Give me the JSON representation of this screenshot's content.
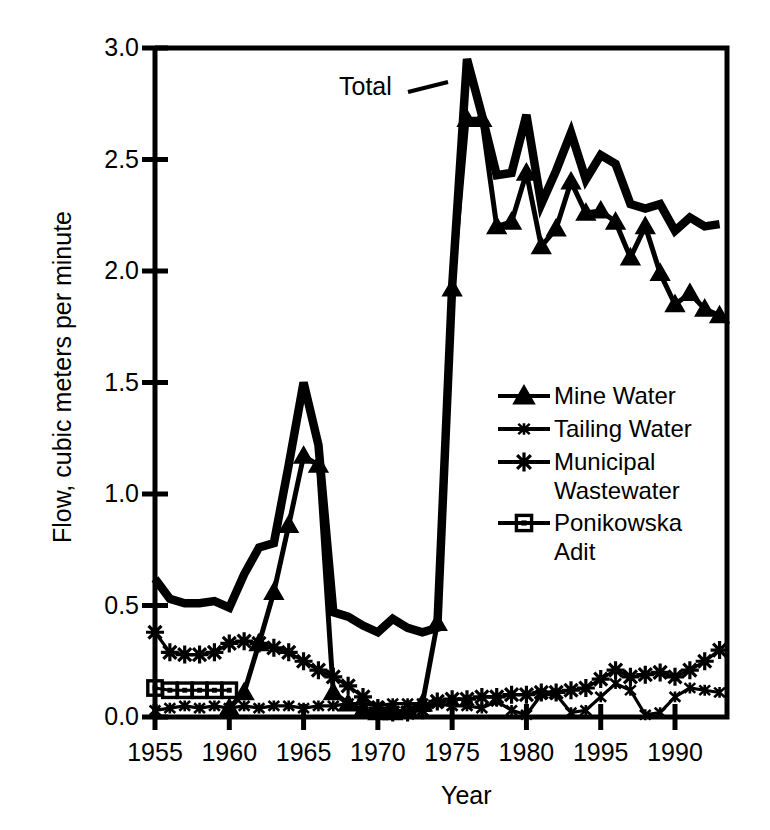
{
  "chart_data": {
    "type": "line",
    "title": "",
    "xlabel": "Year",
    "ylabel": "Flow, cubic meters per minute",
    "xlim": [
      1955,
      1993.5
    ],
    "ylim": [
      0.0,
      3.0
    ],
    "grid": false,
    "legend_position": "middle-right-inside",
    "ytick_labels": [
      "0.0",
      "0.5",
      "1.0",
      "1.5",
      "2.0",
      "2.5",
      "3.0"
    ],
    "ytick_values": [
      0.0,
      0.5,
      1.0,
      1.5,
      2.0,
      2.5,
      3.0
    ],
    "xtick_labels": [
      "1955",
      "1960",
      "1965",
      "1970",
      "1975",
      "1980",
      "1995",
      "1990"
    ],
    "xtick_values": [
      1955,
      1960,
      1965,
      1970,
      1975,
      1980,
      1985,
      1990
    ],
    "annotations": [
      {
        "text": "Total",
        "x": 1974.6,
        "y": 2.78
      }
    ],
    "series": [
      {
        "name": "Total",
        "marker": "none",
        "linewidth": "thick",
        "x": [
          1955,
          1956,
          1957,
          1958,
          1959,
          1960,
          1961,
          1962,
          1963,
          1964,
          1965,
          1966,
          1967,
          1968,
          1969,
          1970,
          1971,
          1972,
          1973,
          1974,
          1975,
          1976,
          1977,
          1978,
          1979,
          1980,
          1981,
          1982,
          1983,
          1984,
          1985,
          1986,
          1987,
          1988,
          1989,
          1990,
          1991,
          1992,
          1993
        ],
        "values": [
          0.62,
          0.53,
          0.51,
          0.51,
          0.52,
          0.49,
          0.64,
          0.76,
          0.78,
          1.13,
          1.5,
          1.22,
          0.47,
          0.45,
          0.41,
          0.38,
          0.44,
          0.4,
          0.38,
          0.4,
          1.93,
          2.95,
          2.7,
          2.43,
          2.44,
          2.7,
          2.3,
          2.45,
          2.62,
          2.41,
          2.52,
          2.48,
          2.3,
          2.28,
          2.3,
          2.18,
          2.24,
          2.2,
          2.21
        ]
      },
      {
        "name": "Mine Water",
        "marker": "filled-triangle",
        "linewidth": "medium",
        "x": [
          1960,
          1961,
          1962,
          1963,
          1964,
          1965,
          1966,
          1967,
          1968,
          1969,
          1970,
          1971,
          1972,
          1973,
          1974,
          1975,
          1976,
          1977,
          1978,
          1979,
          1980,
          1981,
          1982,
          1983,
          1984,
          1985,
          1986,
          1987,
          1988,
          1989,
          1990,
          1991,
          1992,
          1993
        ],
        "values": [
          0.04,
          0.11,
          0.33,
          0.56,
          0.86,
          1.17,
          1.13,
          0.11,
          0.06,
          0.03,
          0.02,
          0.02,
          0.03,
          0.06,
          0.42,
          1.92,
          2.68,
          2.68,
          2.2,
          2.22,
          2.44,
          2.11,
          2.19,
          2.4,
          2.26,
          2.27,
          2.22,
          2.06,
          2.2,
          1.99,
          1.85,
          1.9,
          1.83,
          1.8
        ]
      },
      {
        "name": "Tailing Water",
        "marker": "small-star",
        "linewidth": "thin",
        "x": [
          1955,
          1956,
          1957,
          1958,
          1959,
          1960,
          1961,
          1962,
          1963,
          1964,
          1965,
          1966,
          1967,
          1968,
          1969,
          1970,
          1971,
          1972,
          1973,
          1974,
          1975,
          1976,
          1977,
          1978,
          1979,
          1980,
          1981,
          1982,
          1983,
          1984,
          1985,
          1986,
          1987,
          1988,
          1989,
          1990,
          1991,
          1992,
          1993
        ],
        "values": [
          0.03,
          0.04,
          0.05,
          0.04,
          0.05,
          0.04,
          0.05,
          0.04,
          0.05,
          0.05,
          0.04,
          0.05,
          0.05,
          0.06,
          0.06,
          0.05,
          0.06,
          0.06,
          0.06,
          0.06,
          0.05,
          0.05,
          0.04,
          0.07,
          0.03,
          0.01,
          0.1,
          0.1,
          0.02,
          0.03,
          0.09,
          0.15,
          0.12,
          0.01,
          0.02,
          0.09,
          0.13,
          0.12,
          0.11
        ]
      },
      {
        "name": "Municipal Wastewater",
        "marker": "asterisk",
        "linewidth": "thin",
        "x": [
          1955,
          1956,
          1957,
          1958,
          1959,
          1960,
          1961,
          1962,
          1963,
          1964,
          1965,
          1966,
          1967,
          1968,
          1969,
          1970,
          1971,
          1972,
          1973,
          1974,
          1975,
          1976,
          1977,
          1978,
          1979,
          1980,
          1981,
          1982,
          1983,
          1984,
          1985,
          1986,
          1987,
          1988,
          1989,
          1990,
          1991,
          1992,
          1993
        ],
        "values": [
          0.38,
          0.29,
          0.28,
          0.28,
          0.29,
          0.33,
          0.34,
          0.33,
          0.31,
          0.29,
          0.25,
          0.21,
          0.18,
          0.14,
          0.09,
          0.04,
          0.02,
          0.02,
          0.03,
          0.07,
          0.08,
          0.08,
          0.09,
          0.09,
          0.1,
          0.1,
          0.11,
          0.11,
          0.12,
          0.13,
          0.17,
          0.21,
          0.18,
          0.19,
          0.2,
          0.18,
          0.21,
          0.25,
          0.3
        ]
      },
      {
        "name": "Ponikowska Adit",
        "marker": "square",
        "linewidth": "thin",
        "x": [
          1955,
          1956,
          1957,
          1958,
          1959,
          1960
        ],
        "values": [
          0.13,
          0.12,
          0.12,
          0.12,
          0.12,
          0.12
        ]
      }
    ]
  },
  "legend": {
    "items": [
      {
        "label": "Mine Water",
        "marker": "filled-triangle"
      },
      {
        "label": "Tailing Water",
        "marker": "small-star"
      },
      {
        "label": "Municipal\nWastewater",
        "marker": "asterisk"
      },
      {
        "label": "Ponikowska\nAdit",
        "marker": "square"
      }
    ]
  },
  "colors": {
    "ink": "#000000",
    "background": "#ffffff"
  }
}
